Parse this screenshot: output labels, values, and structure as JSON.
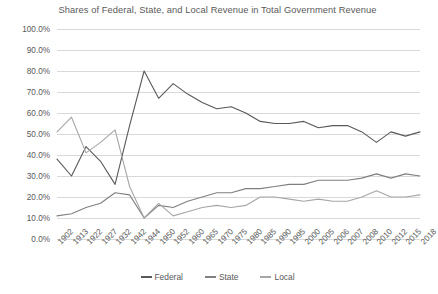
{
  "chart_data": {
    "type": "line",
    "title": "Shares of Federal, State, and Local Revenue in Total Government Revenue",
    "xlabel": "",
    "ylabel": "",
    "ylim": [
      0,
      1.0
    ],
    "y_tick_labels": [
      "100.0%",
      "90.0%",
      "80.0%",
      "70.0%",
      "60.0%",
      "50.0%",
      "40.0%",
      "30.0%",
      "20.0%",
      "10.0%",
      "0.0%"
    ],
    "y_tick_values": [
      1.0,
      0.9,
      0.8,
      0.7,
      0.6,
      0.5,
      0.4,
      0.3,
      0.2,
      0.1,
      0.0
    ],
    "grid": true,
    "legend_position": "bottom",
    "categories": [
      "1902",
      "1913",
      "1922",
      "1927",
      "1932",
      "1942",
      "1944",
      "1950",
      "1952",
      "1960",
      "1965",
      "1970",
      "1975",
      "1980",
      "1985",
      "1990",
      "1995",
      "2000",
      "2005",
      "2006",
      "2007",
      "2008",
      "2010",
      "2012",
      "2015",
      "2018"
    ],
    "series": [
      {
        "name": "Federal",
        "color": "#595959",
        "values": [
          0.38,
          0.3,
          0.44,
          0.37,
          0.26,
          0.54,
          0.8,
          0.67,
          0.74,
          0.69,
          0.65,
          0.62,
          0.63,
          0.6,
          0.56,
          0.55,
          0.55,
          0.56,
          0.53,
          0.54,
          0.54,
          0.51,
          0.46,
          0.51,
          0.49,
          0.51
        ]
      },
      {
        "name": "State",
        "color": "#808080",
        "values": [
          0.11,
          0.12,
          0.15,
          0.17,
          0.22,
          0.21,
          0.1,
          0.16,
          0.15,
          0.18,
          0.2,
          0.22,
          0.22,
          0.24,
          0.24,
          0.25,
          0.26,
          0.26,
          0.28,
          0.28,
          0.28,
          0.29,
          0.31,
          0.29,
          0.31,
          0.3
        ]
      },
      {
        "name": "Local",
        "color": "#a6a6a6",
        "values": [
          0.51,
          0.58,
          0.41,
          0.46,
          0.52,
          0.25,
          0.1,
          0.17,
          0.11,
          0.13,
          0.15,
          0.16,
          0.15,
          0.16,
          0.2,
          0.2,
          0.19,
          0.18,
          0.19,
          0.18,
          0.18,
          0.2,
          0.23,
          0.2,
          0.2,
          0.21
        ]
      }
    ]
  },
  "legend": {
    "items": [
      {
        "label": "Federal"
      },
      {
        "label": "State"
      },
      {
        "label": "Local"
      }
    ]
  }
}
